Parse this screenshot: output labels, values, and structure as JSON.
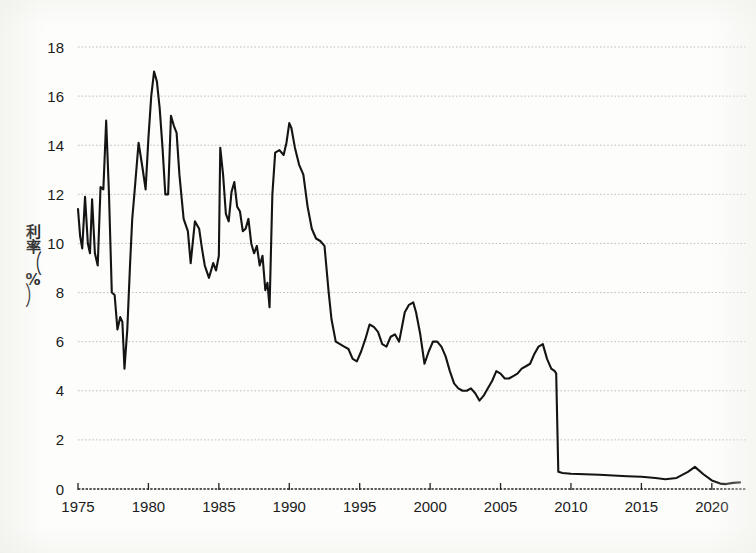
{
  "figure": {
    "background_color": "#fdfdfb",
    "line_color": "#141414",
    "grid_color": "#b9b9b9",
    "axis_color": "#222222"
  },
  "axes": {
    "y_axis_title_chars": [
      "利",
      "率"
    ],
    "y_axis_title_unit_open": "（",
    "y_axis_title_unit": "%",
    "y_axis_title_unit_close": "）",
    "y_axis_title_full": "利率（%）",
    "y_ticks": [
      "0",
      "2",
      "4",
      "6",
      "8",
      "10",
      "12",
      "14",
      "16",
      "18"
    ],
    "x_ticks": [
      "1975",
      "1980",
      "1985",
      "1990",
      "1995",
      "2000",
      "2005",
      "2010",
      "2015",
      "2020"
    ]
  },
  "chart_data": {
    "type": "line",
    "title": "",
    "subtitle": "",
    "xlabel": "",
    "ylabel": "利率（%）",
    "xlim": [
      1975,
      2022
    ],
    "ylim": [
      0,
      18
    ],
    "grid": true,
    "grid_axis": "y",
    "legend": null,
    "legend_position": "none",
    "y_ticks": [
      0,
      2,
      4,
      6,
      8,
      10,
      12,
      14,
      16,
      18
    ],
    "x_ticks": [
      1975,
      1980,
      1985,
      1990,
      1995,
      2000,
      2005,
      2010,
      2015,
      2020
    ],
    "series": [
      {
        "name": "利率",
        "color": "#141414",
        "x": [
          1975.0,
          1975.15,
          1975.3,
          1975.5,
          1975.7,
          1975.85,
          1976.0,
          1976.2,
          1976.4,
          1976.6,
          1976.8,
          1977.0,
          1977.2,
          1977.4,
          1977.6,
          1977.8,
          1978.0,
          1978.15,
          1978.3,
          1978.5,
          1978.7,
          1978.85,
          1979.0,
          1979.3,
          1979.6,
          1979.8,
          1980.0,
          1980.2,
          1980.4,
          1980.6,
          1980.8,
          1981.0,
          1981.2,
          1981.4,
          1981.6,
          1981.8,
          1982.0,
          1982.2,
          1982.5,
          1982.8,
          1983.0,
          1983.3,
          1983.6,
          1983.8,
          1984.0,
          1984.3,
          1984.6,
          1984.8,
          1985.0,
          1985.1,
          1985.3,
          1985.5,
          1985.7,
          1985.9,
          1986.1,
          1986.3,
          1986.5,
          1986.7,
          1986.9,
          1987.1,
          1987.3,
          1987.5,
          1987.7,
          1987.9,
          1988.1,
          1988.3,
          1988.45,
          1988.6,
          1988.8,
          1989.0,
          1989.3,
          1989.6,
          1989.8,
          1990.0,
          1990.15,
          1990.4,
          1990.7,
          1991.0,
          1991.3,
          1991.6,
          1991.9,
          1992.2,
          1992.5,
          1992.8,
          1993.0,
          1993.3,
          1993.6,
          1993.9,
          1994.2,
          1994.5,
          1994.8,
          1995.1,
          1995.4,
          1995.7,
          1996.0,
          1996.3,
          1996.6,
          1996.9,
          1997.2,
          1997.5,
          1997.8,
          1998.0,
          1998.2,
          1998.5,
          1998.8,
          1999.0,
          1999.3,
          1999.6,
          1999.9,
          2000.2,
          2000.5,
          2000.8,
          2001.1,
          2001.4,
          2001.7,
          2002.0,
          2002.3,
          2002.6,
          2002.9,
          2003.2,
          2003.5,
          2003.8,
          2004.1,
          2004.4,
          2004.7,
          2005.0,
          2005.3,
          2005.6,
          2005.9,
          2006.2,
          2006.5,
          2006.8,
          2007.1,
          2007.4,
          2007.7,
          2008.0,
          2008.3,
          2008.6,
          2008.85,
          2008.95,
          2009.1,
          2009.4,
          2010.0,
          2011.0,
          2012.0,
          2013.0,
          2014.0,
          2015.0,
          2016.0,
          2016.7,
          2017.5,
          2018.3,
          2018.8,
          2019.4,
          2020.0,
          2020.6,
          2021.0,
          2021.5,
          2022.0
        ],
        "y": [
          11.4,
          10.3,
          9.8,
          11.9,
          10.0,
          9.6,
          11.8,
          9.6,
          9.1,
          12.3,
          12.2,
          15.0,
          12.0,
          8.0,
          7.9,
          6.5,
          7.0,
          6.8,
          4.9,
          6.5,
          9.2,
          11.0,
          12.0,
          14.1,
          13.0,
          12.2,
          14.3,
          16.0,
          17.0,
          16.6,
          15.5,
          13.9,
          12.0,
          12.0,
          15.2,
          14.8,
          14.5,
          12.8,
          11.0,
          10.5,
          9.2,
          10.9,
          10.6,
          9.8,
          9.1,
          8.6,
          9.2,
          8.9,
          9.5,
          13.9,
          12.8,
          11.2,
          10.9,
          12.1,
          12.5,
          11.5,
          11.3,
          10.5,
          10.6,
          11.0,
          10.0,
          9.6,
          9.9,
          9.1,
          9.5,
          8.1,
          8.4,
          7.4,
          12.0,
          13.7,
          13.8,
          13.6,
          14.1,
          14.9,
          14.7,
          13.9,
          13.2,
          12.8,
          11.5,
          10.6,
          10.2,
          10.1,
          9.9,
          8.0,
          6.9,
          6.0,
          5.9,
          5.8,
          5.7,
          5.3,
          5.2,
          5.6,
          6.1,
          6.7,
          6.6,
          6.4,
          5.9,
          5.8,
          6.2,
          6.3,
          6.0,
          6.6,
          7.2,
          7.5,
          7.6,
          7.2,
          6.3,
          5.1,
          5.6,
          6.0,
          6.0,
          5.8,
          5.4,
          4.8,
          4.3,
          4.1,
          4.0,
          4.0,
          4.1,
          3.9,
          3.6,
          3.8,
          4.1,
          4.4,
          4.8,
          4.7,
          4.5,
          4.5,
          4.6,
          4.7,
          4.9,
          5.0,
          5.1,
          5.5,
          5.8,
          5.9,
          5.3,
          4.9,
          4.8,
          4.7,
          0.7,
          0.65,
          0.62,
          0.6,
          0.58,
          0.55,
          0.52,
          0.5,
          0.45,
          0.4,
          0.45,
          0.7,
          0.9,
          0.6,
          0.35,
          0.22,
          0.2,
          0.25,
          0.27
        ]
      }
    ],
    "notes": [
      "Scanned line chart, single black series",
      "Peak approx 17.0 around 1980",
      "Steep collapse from approx 4.7 to approx 0.7 in 2009",
      "Small rebound peaking near 0.9 around 2019"
    ]
  }
}
